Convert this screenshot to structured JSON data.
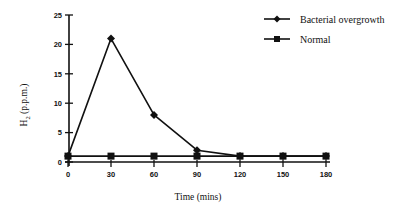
{
  "chart_data": {
    "type": "line",
    "title": "",
    "xlabel": "Time (mins)",
    "ylabel": "H2 (p.p.m.)",
    "ylabel_main": "H",
    "ylabel_sub": "2",
    "ylabel_rest": " (p.p.m.)",
    "x": [
      0,
      30,
      60,
      90,
      120,
      150,
      180
    ],
    "x_ticks": [
      "0",
      "30",
      "60",
      "90",
      "120",
      "150",
      "180"
    ],
    "y_ticks": [
      "0",
      "5",
      "10",
      "15",
      "20",
      "25"
    ],
    "xlim": [
      0,
      180
    ],
    "ylim": [
      0,
      25
    ],
    "grid": false,
    "legend_position": "top-right",
    "series": [
      {
        "name": "Bacterial overgrowth",
        "marker": "diamond",
        "values": [
          1,
          21,
          8,
          2,
          1,
          1,
          1
        ]
      },
      {
        "name": "Normal",
        "marker": "square",
        "values": [
          1,
          1,
          1,
          1,
          1,
          1,
          1
        ]
      }
    ]
  },
  "legend": {
    "items": [
      {
        "label": "Bacterial overgrowth"
      },
      {
        "label": "Normal"
      }
    ]
  }
}
